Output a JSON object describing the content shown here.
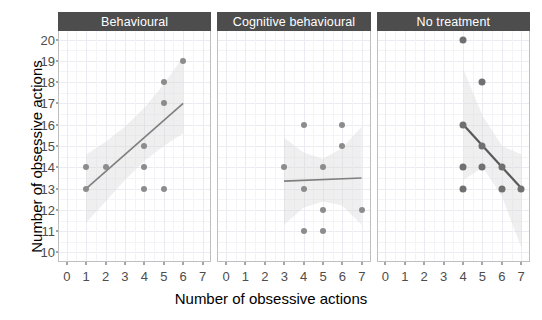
{
  "chart_data": {
    "type": "scatter",
    "title": "",
    "xlabel": "Number of obsessive actions",
    "ylabel": "Number of obsessive actions",
    "xlim": [
      -0.4,
      7.4
    ],
    "ylim": [
      9.6,
      20.4
    ],
    "x_ticks": [
      0,
      1,
      2,
      3,
      4,
      5,
      6,
      7
    ],
    "y_ticks": [
      10,
      11,
      12,
      13,
      14,
      15,
      16,
      17,
      18,
      19,
      20
    ],
    "grid": true,
    "legend": "none",
    "facet_labels": [
      "Behavioural",
      "Cognitive behavioural",
      "No treatment"
    ],
    "point_color": "#8c8c8c",
    "line_color": "#7f7f7f",
    "band_color": "#d9d9d9",
    "strip_color": "#4d4d4d",
    "strip_text_color": "#ffffff",
    "panels": [
      {
        "label": "Behavioural",
        "points": [
          {
            "x": 1,
            "y": 13
          },
          {
            "x": 1,
            "y": 14
          },
          {
            "x": 2,
            "y": 14
          },
          {
            "x": 4,
            "y": 13
          },
          {
            "x": 4,
            "y": 14
          },
          {
            "x": 4,
            "y": 15
          },
          {
            "x": 5,
            "y": 13
          },
          {
            "x": 5,
            "y": 17
          },
          {
            "x": 5,
            "y": 18
          },
          {
            "x": 6,
            "y": 19
          }
        ],
        "fit": {
          "x1": 1,
          "y1": 13.0,
          "x2": 6,
          "y2": 17.0
        },
        "band": {
          "x": [
            1,
            2,
            3,
            4,
            5,
            6
          ],
          "upper": [
            14.6,
            15.2,
            15.9,
            16.8,
            17.9,
            19.2
          ],
          "lower": [
            11.4,
            12.4,
            13.4,
            14.3,
            15.0,
            15.6
          ]
        }
      },
      {
        "label": "Cognitive behavioural",
        "points": [
          {
            "x": 3,
            "y": 14
          },
          {
            "x": 4,
            "y": 16
          },
          {
            "x": 4,
            "y": 13
          },
          {
            "x": 4,
            "y": 11
          },
          {
            "x": 5,
            "y": 14
          },
          {
            "x": 5,
            "y": 12
          },
          {
            "x": 5,
            "y": 11
          },
          {
            "x": 6,
            "y": 16
          },
          {
            "x": 6,
            "y": 15
          },
          {
            "x": 7,
            "y": 12
          }
        ],
        "fit": {
          "x1": 3,
          "y1": 13.35,
          "x2": 7,
          "y2": 13.5
        },
        "band": {
          "x": [
            3,
            4,
            5,
            6,
            7
          ],
          "upper": [
            15.4,
            14.7,
            14.4,
            14.9,
            15.9
          ],
          "lower": [
            11.3,
            12.1,
            12.4,
            12.2,
            11.3
          ]
        }
      },
      {
        "label": "No treatment",
        "points": [
          {
            "x": 4,
            "y": 20
          },
          {
            "x": 4,
            "y": 16
          },
          {
            "x": 4,
            "y": 14
          },
          {
            "x": 4,
            "y": 13
          },
          {
            "x": 5,
            "y": 18
          },
          {
            "x": 5,
            "y": 15
          },
          {
            "x": 5,
            "y": 14
          },
          {
            "x": 6,
            "y": 14
          },
          {
            "x": 6,
            "y": 13
          },
          {
            "x": 7,
            "y": 13
          }
        ],
        "fit": {
          "x1": 4,
          "y1": 16.0,
          "x2": 7,
          "y2": 13.0
        },
        "band": {
          "x": [
            4,
            5,
            6,
            7
          ],
          "upper": [
            18.6,
            16.4,
            15.0,
            14.6
          ],
          "lower": [
            13.4,
            14.0,
            12.6,
            10.2
          ]
        }
      }
    ]
  }
}
